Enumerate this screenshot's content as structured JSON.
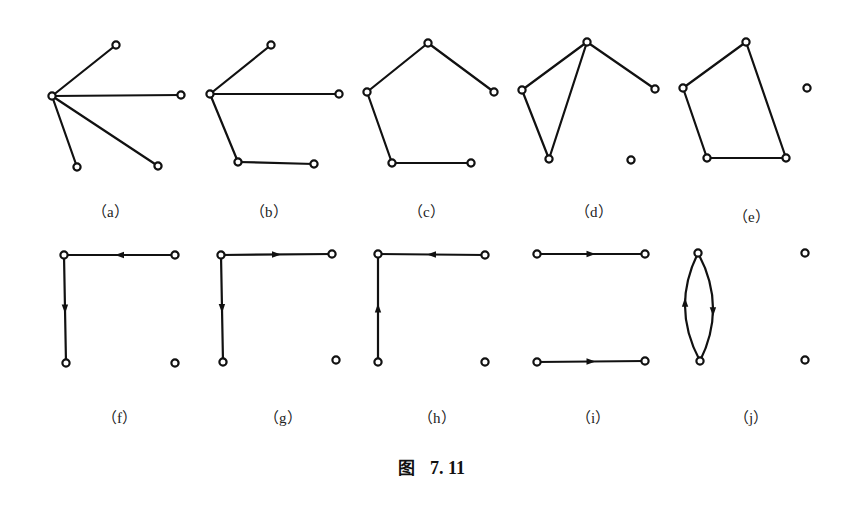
{
  "figure": {
    "caption_prefix": "图",
    "caption_number": "7. 11",
    "subfigures": [
      {
        "id": "a",
        "label": "(a)",
        "directed": false,
        "nodes": [
          "v1",
          "v2",
          "v3",
          "v4",
          "v5"
        ],
        "edges": [
          [
            "v1",
            "v2"
          ],
          [
            "v1",
            "v3"
          ],
          [
            "v1",
            "v4"
          ],
          [
            "v1",
            "v5"
          ]
        ]
      },
      {
        "id": "b",
        "label": "(b)",
        "directed": false,
        "nodes": [
          "v1",
          "v2",
          "v3",
          "v4",
          "v5"
        ],
        "edges": [
          [
            "v1",
            "v2"
          ],
          [
            "v1",
            "v3"
          ],
          [
            "v1",
            "v4"
          ],
          [
            "v4",
            "v5"
          ]
        ]
      },
      {
        "id": "c",
        "label": "(c)",
        "directed": false,
        "nodes": [
          "v1",
          "v2",
          "v3",
          "v4",
          "v5"
        ],
        "edges": [
          [
            "v1",
            "v2"
          ],
          [
            "v1",
            "v3"
          ],
          [
            "v2",
            "v4"
          ],
          [
            "v4",
            "v5"
          ]
        ]
      },
      {
        "id": "d",
        "label": "(d)",
        "directed": false,
        "nodes": [
          "v1",
          "v2",
          "v3",
          "v4",
          "v5"
        ],
        "edges": [
          [
            "v1",
            "v2"
          ],
          [
            "v1",
            "v3"
          ],
          [
            "v1",
            "v4"
          ],
          [
            "v2",
            "v4"
          ]
        ]
      },
      {
        "id": "e",
        "label": "(e)",
        "directed": false,
        "nodes": [
          "v1",
          "v2",
          "v3",
          "v4",
          "v5"
        ],
        "edges": [
          [
            "v1",
            "v2"
          ],
          [
            "v2",
            "v4"
          ],
          [
            "v4",
            "v5"
          ],
          [
            "v5",
            "v1"
          ]
        ]
      },
      {
        "id": "f",
        "label": "(f)",
        "directed": true,
        "nodes": [
          "v1",
          "v2",
          "v3",
          "v4"
        ],
        "edges": [
          [
            "v2",
            "v1"
          ],
          [
            "v1",
            "v3"
          ]
        ]
      },
      {
        "id": "g",
        "label": "(g)",
        "directed": true,
        "nodes": [
          "v1",
          "v2",
          "v3",
          "v4"
        ],
        "edges": [
          [
            "v1",
            "v2"
          ],
          [
            "v1",
            "v3"
          ]
        ]
      },
      {
        "id": "h",
        "label": "(h)",
        "directed": true,
        "nodes": [
          "v1",
          "v2",
          "v3",
          "v4"
        ],
        "edges": [
          [
            "v2",
            "v1"
          ],
          [
            "v3",
            "v1"
          ]
        ]
      },
      {
        "id": "i",
        "label": "(i)",
        "directed": true,
        "nodes": [
          "v1",
          "v2",
          "v3",
          "v4"
        ],
        "edges": [
          [
            "v1",
            "v2"
          ],
          [
            "v3",
            "v4"
          ]
        ]
      },
      {
        "id": "j",
        "label": "(j)",
        "directed": true,
        "nodes": [
          "v1",
          "v2",
          "v3",
          "v4"
        ],
        "edges": [
          [
            "v1",
            "v3"
          ],
          [
            "v3",
            "v1"
          ]
        ]
      }
    ]
  }
}
